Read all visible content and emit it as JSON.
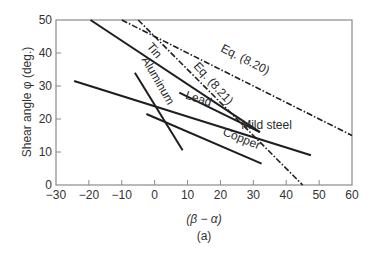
{
  "chart_data": {
    "type": "line",
    "title": "",
    "caption": "(a)",
    "xlabel": "(β − α)",
    "ylabel": "Shear angle φ (deg.)",
    "xlim": [
      -30,
      60
    ],
    "ylim": [
      0,
      50
    ],
    "xticks": [
      -30,
      -20,
      -10,
      0,
      10,
      20,
      30,
      40,
      50,
      60
    ],
    "xtick_labels": [
      "−30",
      "−20",
      "−10",
      "0",
      "10",
      "20",
      "30",
      "40",
      "50",
      "60"
    ],
    "yticks": [
      0,
      10,
      20,
      30,
      40,
      50
    ],
    "ytick_labels": [
      "0",
      "10",
      "20",
      "30",
      "40",
      "50"
    ],
    "grid": false,
    "legend": "inline labels",
    "series": [
      {
        "name": "Eq. (8.20)",
        "style": "dashdot",
        "x": [
          -10,
          60
        ],
        "y": [
          50,
          15
        ]
      },
      {
        "name": "Eq. (8.21)",
        "style": "dashdot",
        "x": [
          -5,
          45
        ],
        "y": [
          50,
          0
        ]
      },
      {
        "name": "Tin",
        "style": "solid",
        "x": [
          -19.5,
          32
        ],
        "y": [
          50,
          16
        ]
      },
      {
        "name": "Aluminum",
        "style": "solid",
        "x": [
          -6,
          8.5
        ],
        "y": [
          34,
          10.5
        ]
      },
      {
        "name": "Lead",
        "style": "solid",
        "x": [
          -24.5,
          47.5
        ],
        "y": [
          31.5,
          9
        ]
      },
      {
        "name": "Mild steel",
        "style": "solid",
        "x": [
          7.5,
          32
        ],
        "y": [
          28,
          16
        ]
      },
      {
        "name": "Copper",
        "style": "solid",
        "x": [
          -2.5,
          32.5
        ],
        "y": [
          21.5,
          6.5
        ]
      }
    ],
    "annotations": [
      {
        "text": "Eq. (8.20)",
        "x": 27,
        "y": 37,
        "rotation": 27
      },
      {
        "text": "Eq. (8.21)",
        "x": 17,
        "y": 30,
        "rotation": 48
      },
      {
        "text": "Tin",
        "x": -1,
        "y": 40,
        "rotation": 50
      },
      {
        "text": "Aluminum",
        "x": 0,
        "y": 31,
        "rotation": 60
      },
      {
        "text": "Lead",
        "x": 13,
        "y": 25,
        "rotation": 17
      },
      {
        "text": "Mild steel",
        "x": 34,
        "y": 17,
        "rotation": 0
      },
      {
        "text": "Copper",
        "x": 26,
        "y": 13,
        "rotation": 22
      }
    ]
  }
}
